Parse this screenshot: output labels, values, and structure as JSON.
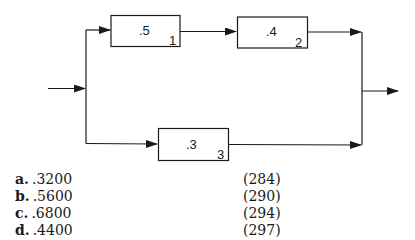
{
  "diagram": {
    "components": [
      {
        "id": "1",
        "reliability": ".5",
        "number": "1"
      },
      {
        "id": "2",
        "reliability": ".4",
        "number": "2"
      },
      {
        "id": "3",
        "reliability": ".3",
        "number": "3"
      }
    ],
    "structure": "Components 1 and 2 in series, in parallel with component 3"
  },
  "answers": [
    {
      "letter": "a.",
      "value": ".3200",
      "page": "(284)"
    },
    {
      "letter": "b.",
      "value": ".5600",
      "page": "(290)"
    },
    {
      "letter": "c.",
      "value": ".6800",
      "page": "(294)"
    },
    {
      "letter": "d.",
      "value": ".4400",
      "page": "(297)"
    }
  ]
}
